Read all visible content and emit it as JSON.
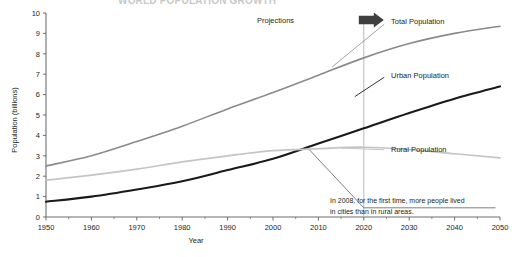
{
  "figure": {
    "clipped_title": "WORLD POPULATION GROWTH",
    "axis_color": "#6d6e71",
    "text_color": "#231f20"
  },
  "annotations": {
    "projections_label": "Projections",
    "projections_start_year": 2020,
    "note_line1": "In 2008, for the first time, more people lived",
    "note_line2": "in cities than in rural areas.",
    "note_year": 2008,
    "note_value": 3.3
  },
  "chart_data": {
    "type": "line",
    "title": "WORLD POPULATION GROWTH",
    "xlabel": "Year",
    "ylabel": "Population (billions)",
    "xlim": [
      1950,
      2050
    ],
    "ylim": [
      0,
      10
    ],
    "xticks": [
      1950,
      1960,
      1970,
      1980,
      1990,
      2000,
      2010,
      2020,
      2030,
      2040,
      2050
    ],
    "yticks": [
      0,
      1,
      2,
      3,
      4,
      5,
      6,
      7,
      8,
      9,
      10
    ],
    "xtick_labels": [
      "1950",
      "1960",
      "1970",
      "1980",
      "1990",
      "2000",
      "2010",
      "2020",
      "2030",
      "2040",
      "2050"
    ],
    "ytick_labels": [
      "0",
      "1",
      "2",
      "3",
      "4",
      "5",
      "6",
      "7",
      "8",
      "9",
      "10"
    ],
    "grid": false,
    "legend": "inline-labels",
    "x": [
      1950,
      1960,
      1970,
      1980,
      1990,
      2000,
      2010,
      2020,
      2030,
      2040,
      2050
    ],
    "series": [
      {
        "name": "Total Population",
        "color": "#8a8a8a",
        "width": 1.6,
        "label_x": 2026,
        "label_y": 9.6,
        "values": [
          2.5,
          3.0,
          3.7,
          4.45,
          5.3,
          6.1,
          6.95,
          7.8,
          8.5,
          9.0,
          9.35
        ]
      },
      {
        "name": "Urban Population",
        "color": "#1a1a1a",
        "width": 2.1,
        "label_x": 2026,
        "label_y": 6.95,
        "values": [
          0.75,
          1.0,
          1.35,
          1.75,
          2.3,
          2.85,
          3.6,
          4.35,
          5.1,
          5.8,
          6.4
        ]
      },
      {
        "name": "Rural Population",
        "color": "#c4c4c4",
        "width": 1.7,
        "label_x": 2026,
        "label_y": 3.3,
        "values": [
          1.8,
          2.05,
          2.35,
          2.7,
          3.0,
          3.25,
          3.35,
          3.42,
          3.3,
          3.1,
          2.9
        ]
      }
    ]
  }
}
